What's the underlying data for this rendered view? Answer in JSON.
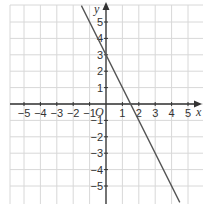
{
  "chart_data": {
    "type": "line",
    "title": "",
    "xlabel": "x",
    "ylabel": "y",
    "origin_label": "O",
    "xlim": [
      -5.9,
      5.9
    ],
    "ylim": [
      -6.1,
      6.0
    ],
    "grid": true,
    "x_ticks": [
      -5,
      -4,
      -3,
      -2,
      -1,
      1,
      2,
      3,
      4,
      5
    ],
    "y_ticks": [
      -5,
      -4,
      -3,
      -2,
      -1,
      1,
      2,
      3,
      4,
      5
    ],
    "series": [
      {
        "name": "y = 3 - 2x",
        "equation": "y = -2x + 3",
        "slope": -2,
        "intercept": 3,
        "x": [
          -1.5,
          4.5
        ],
        "y": [
          6,
          -6
        ]
      }
    ]
  },
  "colors": {
    "grid": "#d8d8d8",
    "axis": "#333333",
    "line": "#555555"
  }
}
